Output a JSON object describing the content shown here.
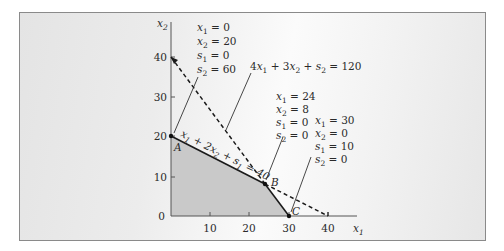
{
  "diagram": {
    "type": "linear-programming-feasible-region",
    "axes": {
      "x_label": "x1",
      "y_label": "x2",
      "x_ticks": [
        "10",
        "20",
        "30",
        "40"
      ],
      "y_ticks": [
        "0",
        "10",
        "20",
        "30",
        "40"
      ]
    },
    "constraints": [
      {
        "id": "c1",
        "equation": "x1 + 2x2 + s1 = 40",
        "style": "solid-segment-and-dashed-extension"
      },
      {
        "id": "c2",
        "equation": "4x1 + 3x2 + s2 = 120",
        "style": "dashed-with-solid-segment"
      }
    ],
    "points": [
      {
        "name": "A",
        "x1": 0,
        "x2": 20
      },
      {
        "name": "B",
        "x1": 24,
        "x2": 8
      },
      {
        "name": "C",
        "x1": 30,
        "x2": 0
      }
    ],
    "annotations": {
      "A": [
        "x1 = 0",
        "x2 = 20",
        "s1 = 0",
        "s2 = 60"
      ],
      "B": [
        "x1 = 24",
        "x2 = 8",
        "s1 = 0",
        "s2 = 0"
      ],
      "C": [
        "x1 = 30",
        "x2 = 0",
        "s1 = 10",
        "s2 = 0"
      ]
    },
    "colors": {
      "feasible_region": "#c9c9c9",
      "lines": "#1a1a1a",
      "frame_border": "#8a8a8a"
    }
  },
  "labels": {
    "x_axis": "x",
    "x_axis_sub": "1",
    "y_axis": "x",
    "y_axis_sub": "2",
    "tick_x_10": "10",
    "tick_x_20": "20",
    "tick_x_30": "30",
    "tick_x_40": "40",
    "tick_y_0": "0",
    "tick_y_10": "10",
    "tick_y_20": "20",
    "tick_y_30": "30",
    "tick_y_40": "40",
    "point_a": "A",
    "point_b": "B",
    "point_c": "C",
    "c2_eq_coef1": "4",
    "c2_eq_rest": " + 3",
    "c2_eq_s": " + ",
    "c2_eq_rhs": " = 120",
    "c1_eq": "x1 + 2x2 + s1 = 40",
    "ann_a": [
      {
        "var": "x",
        "sub": "1",
        "val": " = 0"
      },
      {
        "var": "x",
        "sub": "2",
        "val": " = 20"
      },
      {
        "var": "s",
        "sub": "1",
        "val": " = 0"
      },
      {
        "var": "s",
        "sub": "2",
        "val": " = 60"
      }
    ],
    "ann_b": [
      {
        "var": "x",
        "sub": "1",
        "val": " = 24"
      },
      {
        "var": "x",
        "sub": "2",
        "val": " = 8"
      },
      {
        "var": "s",
        "sub": "1",
        "val": " = 0"
      },
      {
        "var": "s",
        "sub": "2",
        "val": " = 0"
      }
    ],
    "ann_c": [
      {
        "var": "x",
        "sub": "1",
        "val": " = 30"
      },
      {
        "var": "x",
        "sub": "2",
        "val": " = 0"
      },
      {
        "var": "s",
        "sub": "1",
        "val": " = 10"
      },
      {
        "var": "s",
        "sub": "2",
        "val": " = 0"
      }
    ]
  }
}
